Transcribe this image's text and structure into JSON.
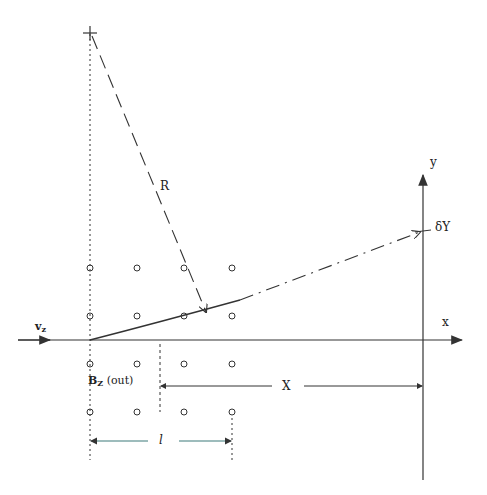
{
  "diagram": {
    "labels": {
      "radius": "R",
      "y_axis": "y",
      "x_axis": "x",
      "deflection": "δY",
      "velocity": "v",
      "velocity_sub": "z",
      "field": "B",
      "field_sub": "Z",
      "field_suffix": " (out)",
      "distance": "X",
      "length": "l"
    },
    "colors": {
      "ink": "#333333",
      "length_bar": "#3d7a7a"
    },
    "field_grid": {
      "columns_x": [
        90,
        137,
        184,
        232
      ],
      "rows_y": [
        268,
        316,
        364,
        412
      ],
      "symbol": "circle-dot-out"
    }
  }
}
